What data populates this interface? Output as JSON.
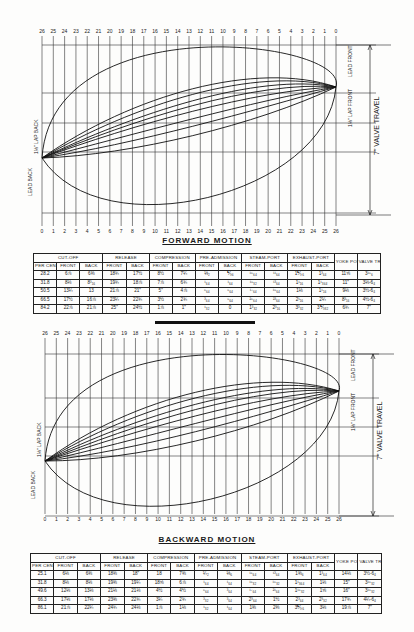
{
  "forward": {
    "caption": "FORWARD MOTION",
    "top_ticks": [
      "26",
      "25",
      "24",
      "23",
      "22",
      "21",
      "20",
      "19",
      "18",
      "17",
      "16",
      "15",
      "14",
      "13",
      "12",
      "11",
      "10",
      "9",
      "8",
      "7",
      "6",
      "5",
      "4",
      "3",
      "2",
      "1",
      "0"
    ],
    "bottom_ticks": [
      "0",
      "1",
      "2",
      "3",
      "4",
      "5",
      "6",
      "7",
      "8",
      "9",
      "10",
      "11",
      "12",
      "13",
      "14",
      "15",
      "16",
      "17",
      "18",
      "19",
      "20",
      "21",
      "22",
      "23",
      "24",
      "25",
      "26"
    ],
    "labels": {
      "lead_front": "LEAD FRONT",
      "lap_front": "1⅓\" LAP FRONT",
      "valve_travel": "7\" VALVE TRAVEL",
      "lead_back": "LEAD BACK",
      "lap_back": "1⅓\" LAP BACK"
    },
    "table": {
      "group_headers": [
        "CUT-OFF",
        "RELEASE",
        "COMPRESSION",
        "PRE-ADMISSION",
        "STEAM-PORT",
        "EXHAUST-PORT",
        "YOKE POSITION",
        "VALVE TRAVEL"
      ],
      "sub_headers": [
        "PER CENT",
        "FRONT",
        "BACK",
        "FRONT",
        "BACK",
        "FRONT",
        "BACK",
        "FRONT",
        "BACK",
        "FRONT",
        "BACK",
        "FRONT",
        "BACK"
      ],
      "rows": [
        [
          "28.2",
          "6⅞",
          "6⅜",
          "18¾",
          "17½",
          "8½",
          "7¼",
          "⅓₂",
          "⅕₆",
          "¹⁵₆₄",
          "¹¹₆₄",
          "1⅕₆",
          "1³₆₄",
          "11⅝",
          "3¹⁵₆"
        ],
        [
          "31.8",
          "8⅛",
          "8³₁₆",
          "19¾",
          "18⅞",
          "7⅞",
          "6¾",
          "¹₆₄",
          "¹₆₄",
          "¹⁵₃₂",
          "¹³₆₄",
          "1¹₁₆",
          "1¹₃₆₄",
          "11\"",
          "3⅛-6₄"
        ],
        [
          "50.5",
          "13¼",
          "13",
          "21⅞",
          "21\"",
          "5\"",
          "4⅞",
          "⁵₆₄",
          "⁵₆₄",
          "¹⁷₆₄",
          "¹⁵₆₄",
          "1⅛",
          "1¹₁₆",
          "9⅛",
          "3½-6₄"
        ],
        [
          "66.5",
          "17½",
          "16⅞",
          "23¼",
          "22¾",
          "3½",
          "2¾",
          "³₆₄",
          "⁵₆₄",
          "²⁵₆₄",
          "²³₆₄",
          "2¹₁₆",
          "2¼",
          "8³₁₆",
          "4½-6₄"
        ],
        [
          "84.2",
          "22⅞",
          "21⅞",
          "25\"",
          "24½",
          "1⅞",
          "1\"",
          "¹₃₂",
          "0",
          "1³₃₂",
          "2³₁₆",
          "3³₃₂",
          "3⅕₃₂",
          "6¾",
          "7\""
        ]
      ]
    }
  },
  "backward": {
    "caption": "BACKWARD MOTION",
    "top_ticks": [
      "26",
      "25",
      "24",
      "23",
      "22",
      "21",
      "20",
      "19",
      "18",
      "17",
      "16",
      "15",
      "14",
      "13",
      "12",
      "11",
      "10",
      "9",
      "8",
      "7",
      "6",
      "5",
      "4",
      "3",
      "2",
      "1",
      "0"
    ],
    "bottom_ticks": [
      "0",
      "1",
      "2",
      "3",
      "4",
      "5",
      "6",
      "7",
      "8",
      "9",
      "10",
      "11",
      "12",
      "13",
      "14",
      "15",
      "16",
      "17",
      "18",
      "19",
      "20",
      "21",
      "22",
      "23",
      "24",
      "25",
      "26"
    ],
    "labels": {
      "lead_front": "LEAD FRONT",
      "lap_front": "1⅓\" LAP FRONT",
      "valve_travel": "7\" VALVE TRAVEL",
      "lead_back": "LEAD BACK",
      "lap_back": "1⅓\" LAP BACK"
    },
    "table": {
      "group_headers": [
        "CUT-OFF",
        "RELEASE",
        "COMPRESSION",
        "PRE-ADMISSION",
        "STEAM-PORT",
        "EXHAUST-PORT",
        "YOKE POSITION",
        "VALVE TRAVEL"
      ],
      "sub_headers": [
        "PER CENT",
        "FRONT",
        "BACK",
        "FRONT",
        "BACK",
        "FRONT",
        "BACK",
        "FRONT",
        "BACK",
        "FRONT",
        "BACK",
        "FRONT",
        "BACK"
      ],
      "rows": [
        [
          "25.1",
          "6⅛",
          "6⅜",
          "18⅜",
          "18\"",
          "18",
          "7⅜",
          "¼₂",
          "⅓₆",
          "¹⁵₆₄",
          "¹³₆₄",
          "1⅜₆",
          "1³₆₄",
          "14⅛",
          "3½-6₄"
        ],
        [
          "31.8",
          "8⅛",
          "8⅛",
          "19⅜",
          "19¼",
          "18⅝",
          "6⅞",
          "¹₆₄",
          "¹₆₄",
          "¹⁵₃₂",
          "¹⁵₃₂",
          "1¹₃₆₄",
          "1⅛",
          "15\"",
          "3¹⁵₃₂"
        ],
        [
          "49.6",
          "12⅛",
          "13⅛",
          "21⅛",
          "21⅛",
          "4½",
          "4½",
          "⁵₆₄",
          "³₆₄",
          "¹⁷₆₄",
          "²¹₆₄",
          "1¹⁵₃₂",
          "1⅝",
          "16\"",
          "3¹⁵₃₂"
        ],
        [
          "66.3",
          "17⅛",
          "17⅛",
          "23⅜",
          "22¾",
          "3¼",
          "2¾",
          "³₃₂",
          "³₆₄",
          "2³₆₄",
          "1½",
          "2³₆₄",
          "2³₃₂",
          "17¾",
          "4¼-6₄"
        ],
        [
          "86.1",
          "21⅞",
          "22¼",
          "24¾",
          "24⅛",
          "1⅞",
          "1⅛",
          "¹₃₂",
          "¹₆₄",
          "1⅜",
          "2⅜",
          "3⅕₆",
          "3⅛",
          "19⅞",
          "7\""
        ]
      ]
    }
  }
}
